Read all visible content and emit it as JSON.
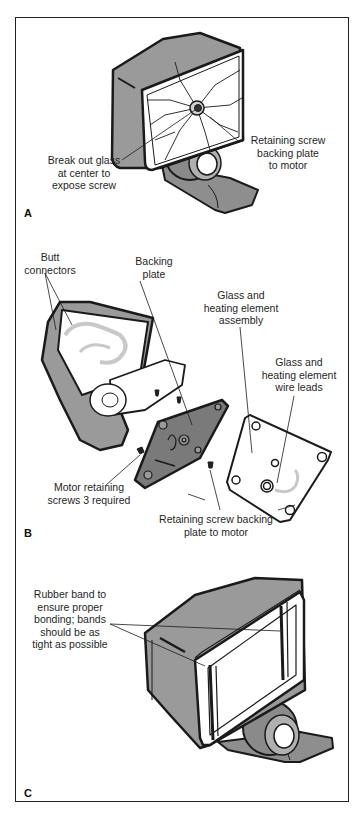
{
  "figure": {
    "panels": [
      {
        "id": "A",
        "label": "A",
        "callouts": [
          {
            "text": "Break out glass\nat center to\nexpose screw"
          },
          {
            "text": "Retaining screw\nbacking plate\nto motor"
          }
        ]
      },
      {
        "id": "B",
        "label": "B",
        "callouts": [
          {
            "text": "Butt\nconnectors"
          },
          {
            "text": "Backing\nplate"
          },
          {
            "text": "Glass and\nheating element\nassembly"
          },
          {
            "text": "Glass and\nheating element\nwire leads"
          },
          {
            "text": "Motor retaining\nscrews 3 required"
          },
          {
            "text": "Retaining screw backing\nplate to motor"
          }
        ]
      },
      {
        "id": "C",
        "label": "C",
        "callouts": [
          {
            "text": "Rubber band to\nensure proper\nbonding; bands\nshould be as\ntight as possible"
          }
        ]
      }
    ],
    "colors": {
      "housing": "#9a9a9a",
      "outline": "#1a1a1a",
      "glass": "#ffffff",
      "wire": "#c8c8c8",
      "plate": "#7a7a7a"
    }
  }
}
